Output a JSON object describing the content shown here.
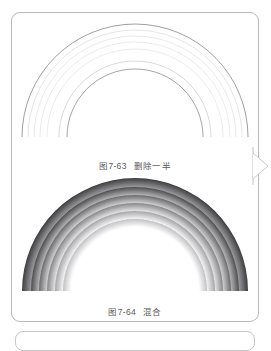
{
  "viewer": {
    "background_color": "#ffffff",
    "page_border_color": "#b9b9b9"
  },
  "page": {
    "card_label": "page-1",
    "next_page_label": "page-2"
  },
  "controls": {
    "next_page_icon": "chevron-right-icon",
    "next_page_label": "下一页"
  },
  "figures": [
    {
      "id": "fig-7-63",
      "caption_number": "图7-63",
      "caption_text": "删除一半",
      "style": "outline",
      "description": "线条弧线彩虹",
      "stroke_color": "#6f6f74",
      "arcs": [
        {
          "radius": 113,
          "opacity": 0.95,
          "width": 0.7
        },
        {
          "radius": 107,
          "opacity": 0.3,
          "width": 0.6
        },
        {
          "radius": 101,
          "opacity": 0.26,
          "width": 0.6
        },
        {
          "radius": 95,
          "opacity": 0.24,
          "width": 0.6
        },
        {
          "radius": 88,
          "opacity": 0.22,
          "width": 0.6
        },
        {
          "radius": 76,
          "opacity": 0.45,
          "width": 0.6
        },
        {
          "radius": 68,
          "opacity": 0.9,
          "width": 0.7
        }
      ]
    },
    {
      "id": "fig-7-64",
      "caption_number": "图7-64",
      "caption_text": "混合",
      "style": "gradient",
      "description": "灰度渐变彩虹",
      "bands": [
        {
          "name": "band-1",
          "outer_radius": 113,
          "inner_radius": 104,
          "outer_color": "#3c3c3e",
          "inner_color": "#9a9a9c"
        },
        {
          "name": "band-2",
          "outer_radius": 104,
          "inner_radius": 96,
          "outer_color": "#4e4e50",
          "inner_color": "#b4b4b6"
        },
        {
          "name": "band-3",
          "outer_radius": 96,
          "inner_radius": 88,
          "outer_color": "#6b6b6e",
          "inner_color": "#cfcfd1"
        },
        {
          "name": "band-4",
          "outer_radius": 88,
          "inner_radius": 80,
          "outer_color": "#87878a",
          "inner_color": "#e4e4e6"
        },
        {
          "name": "band-5",
          "outer_radius": 80,
          "inner_radius": 72,
          "outer_color": "#a6a6a9",
          "inner_color": "#f4f4f5"
        },
        {
          "name": "band-6",
          "outer_radius": 72,
          "inner_radius": 64,
          "outer_color": "#c2c2c5",
          "inner_color": "#ffffff"
        }
      ]
    }
  ]
}
